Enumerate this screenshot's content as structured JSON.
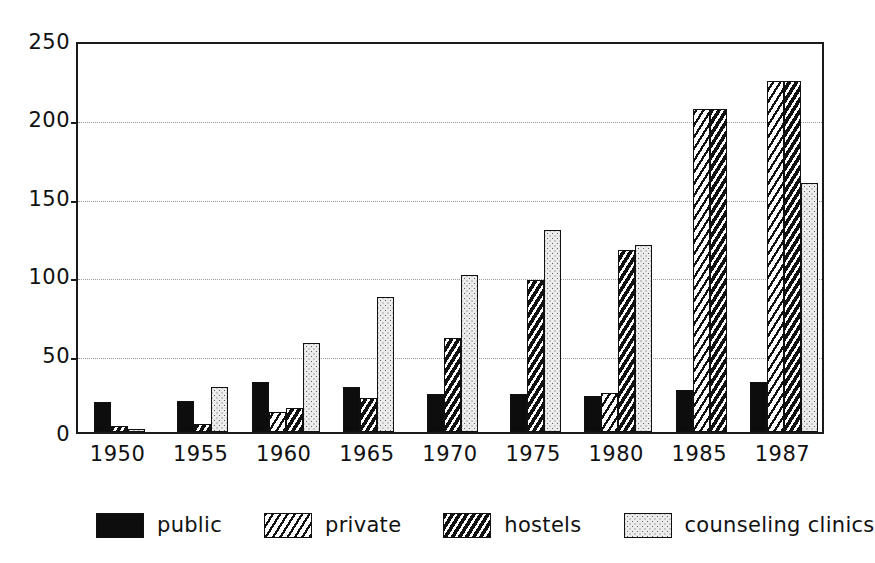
{
  "chart_data": {
    "type": "bar",
    "title": "",
    "subtitle": "",
    "xlabel": "",
    "ylabel": "",
    "categories": [
      "1950",
      "1955",
      "1960",
      "1965",
      "1970",
      "1975",
      "1980",
      "1985",
      "1987"
    ],
    "series": [
      {
        "name": "public",
        "pattern": "solid-black",
        "values": [
          19,
          20,
          32,
          29,
          24,
          24,
          23,
          27,
          32
        ]
      },
      {
        "name": "private",
        "pattern": "light-diagonal",
        "values": [
          0,
          0,
          13,
          0,
          0,
          0,
          25,
          206,
          224
        ]
      },
      {
        "name": "hostels",
        "pattern": "dense-diagonal",
        "values": [
          4,
          5,
          15,
          22,
          60,
          97,
          116,
          206,
          224
        ]
      },
      {
        "name": "counseling clinics",
        "pattern": "dotted-stipple",
        "values": [
          2,
          29,
          57,
          86,
          100,
          129,
          119,
          0,
          159
        ]
      }
    ],
    "ylim": [
      0,
      250
    ],
    "yticks": [
      0,
      50,
      100,
      150,
      200,
      250
    ],
    "ytick_labels": [
      "0",
      "50",
      "100",
      "150",
      "200",
      "250"
    ],
    "grid": true,
    "grid_style": "dotted-horizontal",
    "legend_position": "bottom",
    "legend": [
      "public",
      "private",
      "hostels",
      "counseling clinics"
    ]
  },
  "colors": {
    "axis": "#1a1a1a",
    "grid": "#9a9a9a",
    "public": "#0d0d0d",
    "private": "#ffffff",
    "hostels": "#ffffff",
    "counseling": "#ececec",
    "background": "#ffffff"
  }
}
